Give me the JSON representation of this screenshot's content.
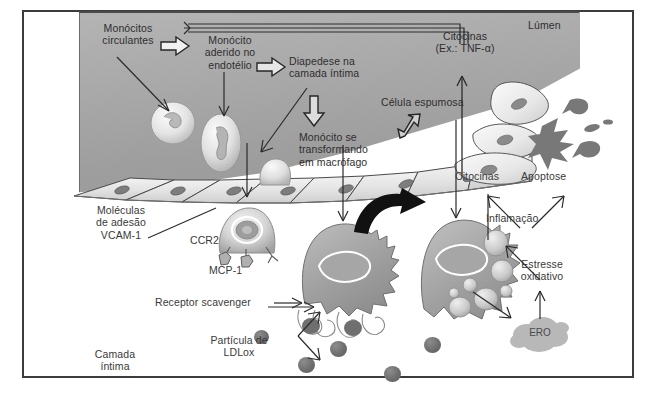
{
  "figure": {
    "language": "pt-BR",
    "frame_color": "#3c3c3c",
    "lumen_color": "#a9a9a9",
    "text_color": "#3a3a3a"
  },
  "labels": {
    "monocitos_circulantes": "Monócitos\ncirculantes",
    "monocito_aderido": "Monócito\naderido no\nendotélio",
    "diapedese": "Diapedese na\ncamada íntima",
    "monocito_macrofago": "Monócito se\ntransformando\nem macrófago",
    "lumen": "Lúmen",
    "citocinas_tnf": "Citocinas\n(Ex.: TNF-α)",
    "celula_espumosa": "Célula espumosa",
    "citocinas": "Citocinas",
    "apoptose": "Apoptose",
    "inflamacao": "Inflamação",
    "estresse_oxidativo": "Estresse\noxidativo",
    "ero": "ERO",
    "moleculas_adesao": "Moléculas\nde adesão\nVCAM-1",
    "ccr2": "CCR2",
    "mcp1": "MCP-1",
    "receptor_scavenger_pre": "Receptor ",
    "receptor_scavenger_ital": "scavenger",
    "particula_ldlox": "Partícula de\nLDLox",
    "camada_intima": "Camada\níntima"
  },
  "structures": {
    "monocyte_count": 3,
    "endothelial_cell_count": 7,
    "macrophage_label": "macrófago",
    "foam_cell_label": "célula espumosa",
    "ldl_particle_count": 5,
    "lipid_droplet_count": 7
  },
  "arrows": {
    "block_arrow_1": "seta-bloco-direita",
    "block_arrow_2": "seta-bloco-direita",
    "block_arrow_down": "seta-bloco-baixo",
    "block_arrow_up": "seta-bloco-diagonal-cima",
    "feedback_loop": "seta-retroalimentacao-citocinas",
    "transformation": "seta-curva-espessa-transformacao"
  }
}
